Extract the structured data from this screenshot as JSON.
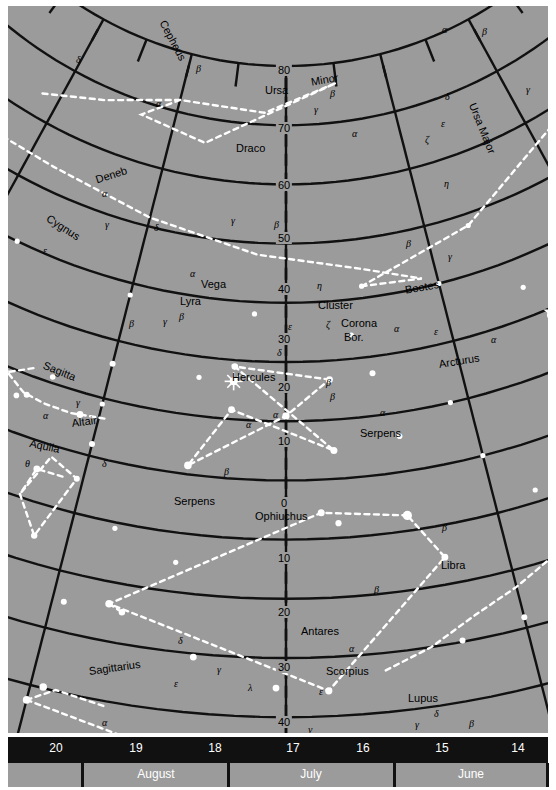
{
  "chart_data": {
    "type": "scatter",
    "xlabel": "Right Ascension (hours)",
    "ylabel": "Declination (degrees)",
    "xlim": [
      20.5,
      13.5
    ],
    "ylim": [
      -45,
      90
    ],
    "grid": true,
    "projection": "conic",
    "ra_ticks": [
      20,
      19,
      18,
      17,
      16,
      15,
      14
    ],
    "dec_ticks": [
      80,
      70,
      60,
      50,
      40,
      30,
      20,
      10,
      0,
      -10,
      -20,
      -30,
      -40
    ],
    "months": [
      "August",
      "July",
      "June"
    ],
    "constellations": [
      "Cepheus",
      "Draco",
      "Ursa Minor",
      "Ursa Major",
      "Cygnus",
      "Lyra",
      "Hercules",
      "Corona Bor.",
      "Bootes",
      "Serpens",
      "Sagitta",
      "Aquila",
      "Ophiuchus",
      "Libra",
      "Sagittarius",
      "Scorpius",
      "Lupus"
    ],
    "named_stars": [
      "Deneb",
      "Vega",
      "Altair",
      "Arcturus",
      "Antares"
    ],
    "deep_sky": [
      "Cluster"
    ]
  },
  "sky": {
    "background_color": "#9b9b9b",
    "grid_color": "#111111",
    "constellation_line_color": "#ffffff",
    "star_color": "#ffffff"
  },
  "declination_labels": [
    {
      "text": "80",
      "x": 276,
      "y": 58
    },
    {
      "text": "70",
      "x": 276,
      "y": 116
    },
    {
      "text": "60",
      "x": 276,
      "y": 173
    },
    {
      "text": "50",
      "x": 276,
      "y": 226
    },
    {
      "text": "40",
      "x": 276,
      "y": 277
    },
    {
      "text": "30",
      "x": 276,
      "y": 327
    },
    {
      "text": "20",
      "x": 276,
      "y": 375
    },
    {
      "text": "10",
      "x": 276,
      "y": 429
    },
    {
      "text": "0",
      "x": 276,
      "y": 491
    },
    {
      "text": "10",
      "x": 276,
      "y": 546
    },
    {
      "text": "20",
      "x": 276,
      "y": 600
    },
    {
      "text": "30",
      "x": 276,
      "y": 655
    },
    {
      "text": "40",
      "x": 276,
      "y": 710
    }
  ],
  "constellation_labels": [
    {
      "text": "Cepheus",
      "x": 160,
      "y": 12,
      "rot": 62,
      "size": "const"
    },
    {
      "text": "Draco",
      "x": 228,
      "y": 136,
      "rot": 0,
      "size": "const"
    },
    {
      "text": "Ursa",
      "x": 257,
      "y": 78,
      "rot": 0,
      "size": "const"
    },
    {
      "text": "Minor",
      "x": 302,
      "y": 70,
      "rot": -10,
      "size": "const"
    },
    {
      "text": "Ursa Major",
      "x": 470,
      "y": 95,
      "rot": 68,
      "size": "const"
    },
    {
      "text": "Cygnus",
      "x": 43,
      "y": 206,
      "rot": 33,
      "size": "const"
    },
    {
      "text": "Lyra",
      "x": 172,
      "y": 289,
      "rot": 0,
      "size": "const"
    },
    {
      "text": "Hercules",
      "x": 224,
      "y": 365,
      "rot": 0,
      "size": "const"
    },
    {
      "text": "Cluster",
      "x": 310,
      "y": 293,
      "rot": 0,
      "size": "const"
    },
    {
      "text": "Corona",
      "x": 333,
      "y": 311,
      "rot": 0,
      "size": "const"
    },
    {
      "text": "Bor.",
      "x": 336,
      "y": 325,
      "rot": 0,
      "size": "const"
    },
    {
      "text": "Bootes",
      "x": 396,
      "y": 278,
      "rot": -10,
      "size": "const"
    },
    {
      "text": "Serpens",
      "x": 352,
      "y": 421,
      "rot": 0,
      "size": "const"
    },
    {
      "text": "Serpens",
      "x": 166,
      "y": 489,
      "rot": 0,
      "size": "const"
    },
    {
      "text": "Sagitta",
      "x": 38,
      "y": 353,
      "rot": 22,
      "size": "const"
    },
    {
      "text": "Aquila",
      "x": 23,
      "y": 431,
      "rot": 12,
      "size": "const"
    },
    {
      "text": "Ophiuchus",
      "x": 247,
      "y": 504,
      "rot": 0,
      "size": "const"
    },
    {
      "text": "Libra",
      "x": 433,
      "y": 553,
      "rot": 0,
      "size": "const"
    },
    {
      "text": "Sagittarius",
      "x": 80,
      "y": 659,
      "rot": -8,
      "size": "const"
    },
    {
      "text": "Scorpius",
      "x": 318,
      "y": 659,
      "rot": 0,
      "size": "const"
    },
    {
      "text": "Lupus",
      "x": 400,
      "y": 686,
      "rot": 0,
      "size": "const"
    },
    {
      "text": "Antares",
      "x": 293,
      "y": 619,
      "rot": 0,
      "size": "const"
    }
  ],
  "star_labels": [
    {
      "text": "Deneb",
      "x": 86,
      "y": 168,
      "rot": -18
    },
    {
      "text": "Vega",
      "x": 193,
      "y": 272,
      "rot": 0
    },
    {
      "text": "Altair",
      "x": 63,
      "y": 411,
      "rot": -7
    },
    {
      "text": "Arcturus",
      "x": 430,
      "y": 352,
      "rot": -9
    }
  ],
  "greek_labels": [
    {
      "t": "δ",
      "x": 68,
      "y": 48
    },
    {
      "t": "β",
      "x": 188,
      "y": 57
    },
    {
      "t": "α",
      "x": 148,
      "y": 92
    },
    {
      "t": "α",
      "x": 434,
      "y": 18
    },
    {
      "t": "β",
      "x": 474,
      "y": 20
    },
    {
      "t": "γ",
      "x": 518,
      "y": 78
    },
    {
      "t": "δ",
      "x": 437,
      "y": 85
    },
    {
      "t": "ε",
      "x": 433,
      "y": 112
    },
    {
      "t": "ζ",
      "x": 417,
      "y": 128
    },
    {
      "t": "η",
      "x": 436,
      "y": 172
    },
    {
      "t": "β",
      "x": 322,
      "y": 82
    },
    {
      "t": "γ",
      "x": 306,
      "y": 98
    },
    {
      "t": "α",
      "x": 344,
      "y": 122
    },
    {
      "t": "α",
      "x": 94,
      "y": 182
    },
    {
      "t": "γ",
      "x": 97,
      "y": 213
    },
    {
      "t": "δ",
      "x": 146,
      "y": 216
    },
    {
      "t": "ε",
      "x": 35,
      "y": 239
    },
    {
      "t": "β",
      "x": 121,
      "y": 312
    },
    {
      "t": "γ",
      "x": 223,
      "y": 209
    },
    {
      "t": "β",
      "x": 266,
      "y": 213
    },
    {
      "t": "β",
      "x": 398,
      "y": 232
    },
    {
      "t": "γ",
      "x": 440,
      "y": 245
    },
    {
      "t": "ε",
      "x": 426,
      "y": 320
    },
    {
      "t": "α",
      "x": 483,
      "y": 328
    },
    {
      "t": "α",
      "x": 182,
      "y": 262
    },
    {
      "t": "γ",
      "x": 155,
      "y": 310
    },
    {
      "t": "β",
      "x": 171,
      "y": 305
    },
    {
      "t": "η",
      "x": 309,
      "y": 274
    },
    {
      "t": "ζ",
      "x": 318,
      "y": 313
    },
    {
      "t": "ε",
      "x": 280,
      "y": 315
    },
    {
      "t": "δ",
      "x": 269,
      "y": 341
    },
    {
      "t": "β",
      "x": 318,
      "y": 371
    },
    {
      "t": "α",
      "x": 386,
      "y": 317
    },
    {
      "t": "α",
      "x": 372,
      "y": 401
    },
    {
      "t": "β",
      "x": 322,
      "y": 385
    },
    {
      "t": "γ",
      "x": 68,
      "y": 391
    },
    {
      "t": "α",
      "x": 35,
      "y": 404
    },
    {
      "t": "θ",
      "x": 17,
      "y": 452
    },
    {
      "t": "δ",
      "x": 94,
      "y": 452
    },
    {
      "t": "α",
      "x": 238,
      "y": 413
    },
    {
      "t": "α",
      "x": 265,
      "y": 403
    },
    {
      "t": "β",
      "x": 216,
      "y": 460
    },
    {
      "t": "β",
      "x": 434,
      "y": 516
    },
    {
      "t": "β",
      "x": 366,
      "y": 578
    },
    {
      "t": "α",
      "x": 341,
      "y": 637
    },
    {
      "t": "ε",
      "x": 311,
      "y": 680
    },
    {
      "t": "ν",
      "x": 300,
      "y": 718
    },
    {
      "t": "δ",
      "x": 170,
      "y": 629
    },
    {
      "t": "γ",
      "x": 209,
      "y": 658
    },
    {
      "t": "ε",
      "x": 166,
      "y": 672
    },
    {
      "t": "λ",
      "x": 240,
      "y": 676
    },
    {
      "t": "θ",
      "x": 234,
      "y": 731
    },
    {
      "t": "α",
      "x": 94,
      "y": 711
    },
    {
      "t": "γ",
      "x": 407,
      "y": 713
    },
    {
      "t": "δ",
      "x": 426,
      "y": 702
    },
    {
      "t": "β",
      "x": 461,
      "y": 712
    },
    {
      "t": "α",
      "x": 470,
      "y": 735
    }
  ],
  "hour_scale": {
    "labels": [
      {
        "text": "20",
        "x": 48
      },
      {
        "text": "19",
        "x": 128
      },
      {
        "text": "18",
        "x": 207
      },
      {
        "text": "17",
        "x": 285
      },
      {
        "text": "16",
        "x": 355
      },
      {
        "text": "15",
        "x": 434
      },
      {
        "text": "14",
        "x": 510
      }
    ]
  },
  "month_scale": {
    "labels": [
      {
        "text": "August",
        "x": 148
      },
      {
        "text": "July",
        "x": 303
      },
      {
        "text": "June",
        "x": 463
      }
    ],
    "dividers": [
      73,
      219,
      385,
      538
    ]
  }
}
